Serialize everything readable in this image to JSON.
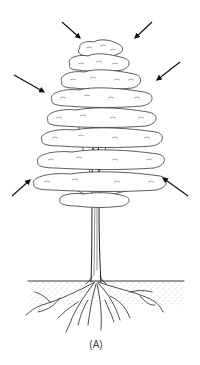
{
  "figure": {
    "caption": "(A)",
    "arrows": [
      {
        "name": "arrow-top-left",
        "from": [
          62,
          22
        ],
        "to": [
          80,
          38
        ]
      },
      {
        "name": "arrow-top-right",
        "from": [
          152,
          22
        ],
        "to": [
          135,
          38
        ]
      },
      {
        "name": "arrow-mid-left",
        "from": [
          14,
          75
        ],
        "to": [
          44,
          92
        ]
      },
      {
        "name": "arrow-mid-right",
        "from": [
          180,
          62
        ],
        "to": [
          157,
          80
        ]
      },
      {
        "name": "arrow-low-left",
        "from": [
          12,
          196
        ],
        "to": [
          30,
          180
        ]
      },
      {
        "name": "arrow-low-right",
        "from": [
          188,
          196
        ],
        "to": [
          163,
          178
        ]
      }
    ]
  }
}
